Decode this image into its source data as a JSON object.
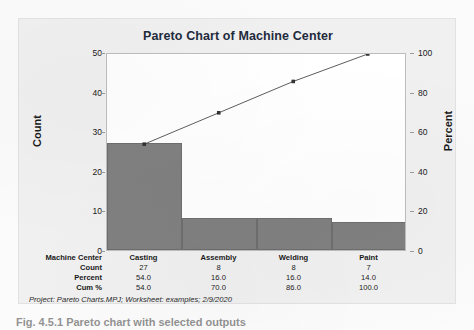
{
  "figure": {
    "caption": "Fig. 4.5.1   Pareto chart with selected outputs"
  },
  "chart_panel": {
    "title": "Pareto Chart of Machine Center",
    "footer": "Project: Pareto Charts.MPJ; Worksheet: examples; 2/9/2020",
    "bar_color": "#808080",
    "line_color": "#333333",
    "panel_bg": "#f0f0f0",
    "plot_bg": "#ffffff"
  },
  "axes": {
    "left": {
      "title": "Count",
      "ticks": [
        "0",
        "10",
        "20",
        "30",
        "40",
        "50"
      ],
      "min": 0,
      "max": 50
    },
    "right": {
      "title": "Percent",
      "ticks": [
        "0",
        "20",
        "40",
        "60",
        "80",
        "100"
      ],
      "min": 0,
      "max": 100
    }
  },
  "table": {
    "rows": [
      {
        "label": "Machine Center",
        "values": [
          "Casting",
          "Assembly",
          "Welding",
          "Paint"
        ]
      },
      {
        "label": "Count",
        "values": [
          "27",
          "8",
          "8",
          "7"
        ]
      },
      {
        "label": "Percent",
        "values": [
          "54.0",
          "16.0",
          "16.0",
          "14.0"
        ]
      },
      {
        "label": "Cum %",
        "values": [
          "54.0",
          "70.0",
          "86.0",
          "100.0"
        ]
      }
    ]
  },
  "chart_data": {
    "type": "bar",
    "title": "Pareto Chart of Machine Center",
    "xlabel": "Machine Center",
    "ylabel": "Count",
    "y2label": "Percent",
    "categories": [
      "Casting",
      "Assembly",
      "Welding",
      "Paint"
    ],
    "values": [
      27,
      8,
      8,
      7
    ],
    "percent": [
      54.0,
      16.0,
      16.0,
      14.0
    ],
    "cumulative_percent": [
      54.0,
      70.0,
      86.0,
      100.0
    ],
    "ylim": [
      0,
      50
    ],
    "y2lim": [
      0,
      100
    ],
    "yticks": [
      0,
      10,
      20,
      30,
      40,
      50
    ],
    "y2ticks": [
      0,
      20,
      40,
      60,
      80,
      100
    ],
    "grid": false,
    "legend": "none",
    "series": [
      {
        "name": "Count",
        "type": "bar",
        "values": [
          27,
          8,
          8,
          7
        ]
      },
      {
        "name": "Cum %",
        "type": "line",
        "values": [
          54.0,
          70.0,
          86.0,
          100.0
        ],
        "axis": "right"
      }
    ]
  }
}
